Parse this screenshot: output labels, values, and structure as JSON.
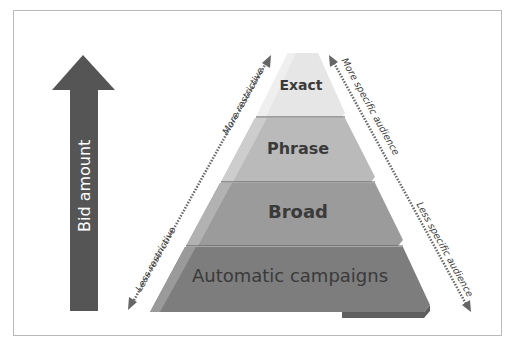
{
  "diagram": {
    "type": "pyramid",
    "bid_arrow": {
      "label": "Bid amount",
      "color": "#555555"
    },
    "layers": [
      {
        "label": "Exact",
        "color": "#e4e4e4"
      },
      {
        "label": "Phrase",
        "color": "#b8b8b8"
      },
      {
        "label": "Broad",
        "color": "#999999"
      },
      {
        "label": "Automatic campaigns",
        "color": "#7f7f7f"
      }
    ],
    "left_axis": {
      "top_label": "More restrictive",
      "bottom_label": "Less restrictive"
    },
    "right_axis": {
      "top_label": "More specific audience",
      "bottom_label": "Less specific audience"
    },
    "colors": {
      "arrow": "#555555",
      "border": "#b9b9b9",
      "text": "#3a3a3a"
    }
  }
}
